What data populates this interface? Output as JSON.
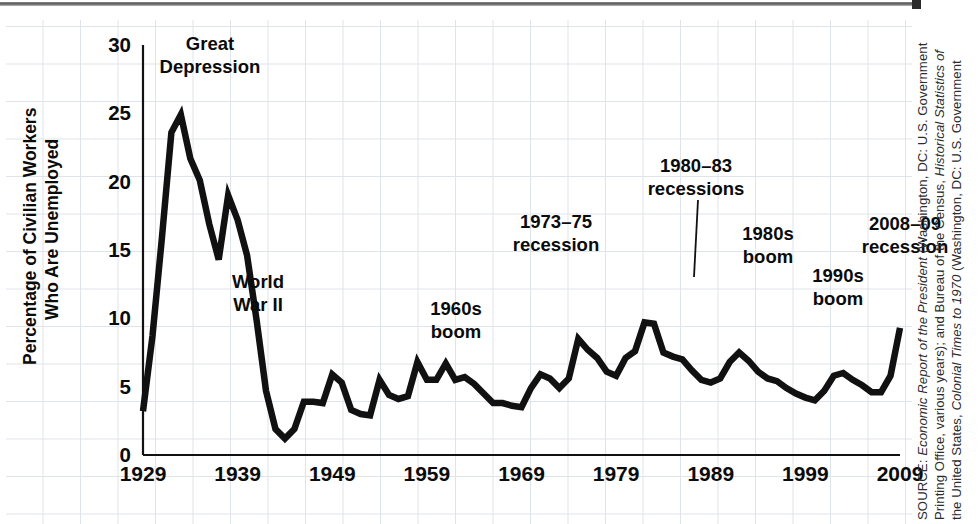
{
  "figure": {
    "page_edge": "scanned-page-edge"
  },
  "chart_data": {
    "type": "line",
    "title": "",
    "xlabel": "",
    "ylabel": "Percentage of Civilian Workers Who Are Unemployed",
    "ylabel_line1": "Percentage of Civilian Workers",
    "ylabel_line2": "Who Are Unemployed",
    "xlim": [
      1929,
      2009
    ],
    "ylim": [
      0,
      30
    ],
    "yticks": [
      0,
      5,
      10,
      15,
      20,
      25,
      30
    ],
    "ytick_labels": [
      "0",
      "5",
      "10",
      "15",
      "20",
      "25",
      "30"
    ],
    "xticks": [
      1929,
      1939,
      1949,
      1959,
      1969,
      1979,
      1989,
      1999,
      2009
    ],
    "xtick_labels": [
      "1929",
      "1939",
      "1949",
      "1959",
      "1969",
      "1979",
      "1989",
      "1999",
      "2009"
    ],
    "grid": true,
    "legend": "none",
    "series_name": "Unemployment rate",
    "x": [
      1929,
      1930,
      1931,
      1932,
      1933,
      1934,
      1935,
      1936,
      1937,
      1938,
      1939,
      1940,
      1941,
      1942,
      1943,
      1944,
      1945,
      1946,
      1947,
      1948,
      1949,
      1950,
      1951,
      1952,
      1953,
      1954,
      1955,
      1956,
      1957,
      1958,
      1959,
      1960,
      1961,
      1962,
      1963,
      1964,
      1965,
      1966,
      1967,
      1968,
      1969,
      1970,
      1971,
      1972,
      1973,
      1974,
      1975,
      1976,
      1977,
      1978,
      1979,
      1980,
      1981,
      1982,
      1983,
      1984,
      1985,
      1986,
      1987,
      1988,
      1989,
      1990,
      1991,
      1992,
      1993,
      1994,
      1995,
      1996,
      1997,
      1998,
      1999,
      2000,
      2001,
      2002,
      2003,
      2004,
      2005,
      2006,
      2007,
      2008,
      2009
    ],
    "values": [
      3.2,
      8.7,
      15.9,
      23.6,
      24.9,
      21.7,
      20.1,
      16.9,
      14.3,
      19.0,
      17.2,
      14.6,
      9.9,
      4.7,
      1.9,
      1.2,
      1.9,
      3.9,
      3.9,
      3.8,
      5.9,
      5.3,
      3.3,
      3.0,
      2.9,
      5.5,
      4.4,
      4.1,
      4.3,
      6.8,
      5.5,
      5.5,
      6.7,
      5.5,
      5.7,
      5.2,
      4.5,
      3.8,
      3.8,
      3.6,
      3.5,
      4.9,
      5.9,
      5.6,
      4.9,
      5.6,
      8.5,
      7.7,
      7.1,
      6.1,
      5.8,
      7.1,
      7.6,
      9.7,
      9.6,
      7.5,
      7.2,
      7.0,
      6.2,
      5.5,
      5.3,
      5.6,
      6.8,
      7.5,
      6.9,
      6.1,
      5.6,
      5.4,
      4.9,
      4.5,
      4.2,
      4.0,
      4.7,
      5.8,
      6.0,
      5.5,
      5.1,
      4.6,
      4.6,
      5.8,
      9.3
    ],
    "annotations": [
      {
        "id": "great-depression",
        "line1": "Great",
        "line2": "Depression",
        "x": 210,
        "y": 50,
        "leader": null
      },
      {
        "id": "world-war-ii",
        "line1": "World",
        "line2": "War II",
        "x": 258,
        "y": 288,
        "leader": null
      },
      {
        "id": "1960s-boom",
        "line1": "1960s",
        "line2": "boom",
        "x": 456,
        "y": 315,
        "leader": null
      },
      {
        "id": "1973-75-recession",
        "line1": "1973–75",
        "line2": "recession",
        "x": 556,
        "y": 228,
        "leader": null
      },
      {
        "id": "1980-83-recessions",
        "line1": "1980–83",
        "line2": "recessions",
        "x": 696,
        "y": 172,
        "leader": {
          "x1": 698,
          "y1": 200,
          "x2": 694,
          "y2": 277
        }
      },
      {
        "id": "1980s-boom",
        "line1": "1980s",
        "line2": "boom",
        "x": 768,
        "y": 240,
        "leader": null
      },
      {
        "id": "1990s-boom",
        "line1": "1990s",
        "line2": "boom",
        "x": 838,
        "y": 282,
        "leader": null
      },
      {
        "id": "2008-09-recession",
        "line1": "2008–09",
        "line2": "recession",
        "x": 905,
        "y": 230,
        "leader": null
      }
    ]
  },
  "source": {
    "line1_prefix": "SOURCE: ",
    "line1_italic": "Economic Report of the President",
    "line1_suffix": " (Washington, DC: U.S. Government",
    "line2_prefix": "Printing Office, various years); and Bureau of the Census, ",
    "line2_italic": "Historical Statistics of",
    "line3_prefix": "the United States, ",
    "line3_italic": "Colonial Times to 1970",
    "line3_suffix": " (Washington, DC: U.S. Government"
  },
  "colors": {
    "line": "#111111",
    "axis": "#111111",
    "grid": "#dfe3ea",
    "text": "#0b0b0b",
    "source_text": "#2c2c2c",
    "background": "#ffffff"
  }
}
